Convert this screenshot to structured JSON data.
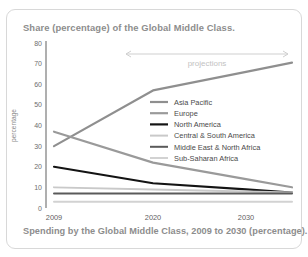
{
  "card": {
    "title": "Share (percentage) of the Global Middle Class.",
    "caption": "Spending by the Global Middle Class, 2009 to 2030 (percentage)."
  },
  "annotation": {
    "projections_label": "projections"
  },
  "chart_data": {
    "type": "line",
    "title": "Share (percentage) of the Global Middle Class.",
    "xlabel": "",
    "ylabel": "percentage",
    "x": [
      2009,
      2020,
      2030
    ],
    "categories": [
      "2009",
      "2020",
      "2030"
    ],
    "xticklabels": [
      "2009",
      "2020",
      "2030"
    ],
    "yticks": [
      0,
      10,
      20,
      30,
      40,
      50,
      60,
      70,
      80
    ],
    "yticklabels": [
      "0",
      "10",
      "20",
      "30",
      "40",
      "50",
      "60",
      "70",
      "80"
    ],
    "ylim": [
      0,
      80
    ],
    "grid": false,
    "legend_position": "center-right",
    "series": [
      {
        "name": "Asia Pacific",
        "values": [
          30,
          57,
          66
        ],
        "color": "#8f8f8f",
        "width": 2.2
      },
      {
        "name": "Europe",
        "values": [
          37,
          22,
          14
        ],
        "color": "#9a9a9a",
        "width": 2.2
      },
      {
        "name": "North America",
        "values": [
          20,
          12,
          9
        ],
        "color": "#141414",
        "width": 2.2
      },
      {
        "name": "Central & South America",
        "values": [
          10,
          9,
          8
        ],
        "color": "#c9c9c9",
        "width": 2.0
      },
      {
        "name": "Middle East & North Africa",
        "values": [
          7,
          7,
          7
        ],
        "color": "#5a5a5a",
        "width": 2.0
      },
      {
        "name": "Sub-Saharan Africa",
        "values": [
          3,
          3,
          3
        ],
        "color": "#d2d2d2",
        "width": 2.0
      }
    ]
  },
  "colors": {
    "frame": "#d8d8d8",
    "title_text": "#8d8d8d",
    "axis": "#9b9b9b",
    "tick_text": "#6e6e6e"
  }
}
